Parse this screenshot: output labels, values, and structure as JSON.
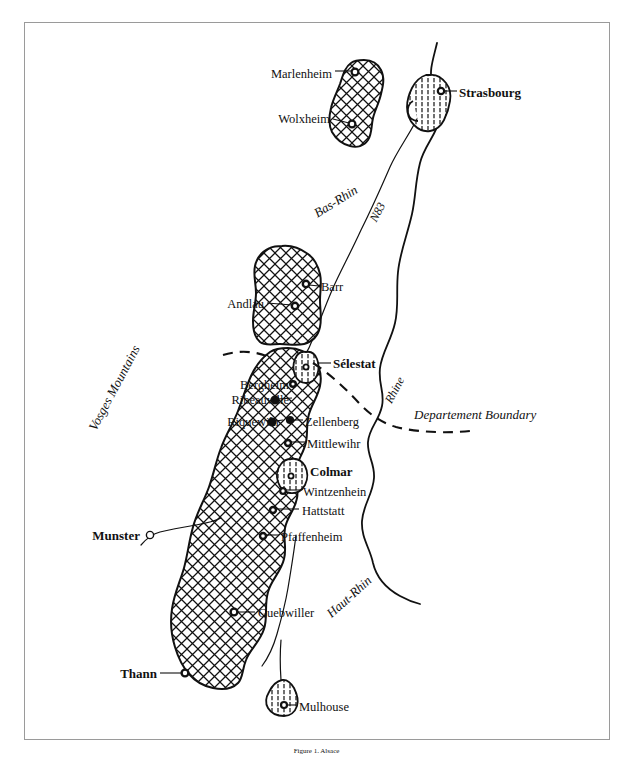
{
  "figure": {
    "kind": "map",
    "caption": "Figure 1. Alsace"
  },
  "map": {
    "title_hidden": "Alsace wine region map",
    "regions": [
      {
        "name": "Bas-Rhin",
        "style": "italic-rotated",
        "x": 338,
        "y": 205,
        "rotation": -32
      },
      {
        "name": "Haut-Rhin",
        "style": "italic-rotated",
        "x": 352,
        "y": 600,
        "rotation": -42
      },
      {
        "name": "Vosges Mountains",
        "style": "italic-rotated",
        "x": 118,
        "y": 390,
        "rotation": -62
      }
    ],
    "features": [
      {
        "name": "Rhine",
        "type": "river-label",
        "x": 398,
        "y": 392,
        "rotation": -62
      },
      {
        "name": "N83",
        "type": "road-label",
        "x": 381,
        "y": 214,
        "rotation": -62
      },
      {
        "name": "Departement Boundary",
        "type": "boundary-label",
        "x": 414,
        "y": 418,
        "rotation": 0
      }
    ],
    "places": [
      {
        "label": "Marlenheim",
        "bold": false,
        "anchor": "end",
        "tx": 332,
        "ty": 74,
        "mx": 355,
        "my": 72,
        "marker": "ring"
      },
      {
        "label": "Wolxheim",
        "bold": false,
        "anchor": "end",
        "tx": 330,
        "ty": 119,
        "mx": 352,
        "my": 124,
        "marker": "ring"
      },
      {
        "label": "Strasbourg",
        "bold": true,
        "anchor": "start",
        "tx": 459,
        "ty": 94,
        "mx": 441,
        "my": 91,
        "marker": "ring"
      },
      {
        "label": "Barr",
        "bold": false,
        "anchor": "start",
        "tx": 321,
        "ty": 289,
        "mx": 306,
        "my": 284,
        "marker": "ring"
      },
      {
        "label": "Andlau",
        "bold": false,
        "anchor": "end",
        "tx": 264,
        "ty": 303,
        "mx": 295,
        "my": 306,
        "marker": "ring"
      },
      {
        "label": "Sélestat",
        "bold": true,
        "anchor": "start",
        "tx": 333,
        "ty": 364,
        "mx": 313,
        "my": 362,
        "marker": "urban"
      },
      {
        "label": "Bergheim",
        "bold": false,
        "anchor": "end",
        "tx": 289,
        "ty": 387,
        "mx": 293,
        "my": 384,
        "marker": "ring"
      },
      {
        "label": "Ribeauville",
        "bold": false,
        "anchor": "end",
        "tx": 289,
        "ty": 401,
        "mx": 275,
        "my": 400,
        "marker": "ring"
      },
      {
        "label": "Riquewihr",
        "bold": false,
        "anchor": "end",
        "tx": 280,
        "ty": 422,
        "mx": 272,
        "my": 422,
        "marker": "ring"
      },
      {
        "label": "Zellenberg",
        "bold": false,
        "anchor": "start",
        "tx": 305,
        "ty": 423,
        "mx": 290,
        "my": 420,
        "marker": "ring"
      },
      {
        "label": "Mittlewihr",
        "bold": false,
        "anchor": "start",
        "tx": 307,
        "ty": 445,
        "mx": 288,
        "my": 443,
        "marker": "ring"
      },
      {
        "label": "Colmar",
        "bold": true,
        "anchor": "start",
        "tx": 310,
        "ty": 471,
        "mx": 293,
        "my": 470,
        "marker": "urban"
      },
      {
        "label": "Wintzenhein",
        "bold": false,
        "anchor": "start",
        "tx": 303,
        "ty": 493,
        "mx": 283,
        "my": 491,
        "marker": "ring"
      },
      {
        "label": "Hattstatt",
        "bold": false,
        "anchor": "start",
        "tx": 302,
        "ty": 512,
        "mx": 273,
        "my": 510,
        "marker": "ring"
      },
      {
        "label": "Pfaffenheim",
        "bold": false,
        "anchor": "start",
        "tx": 281,
        "ty": 538,
        "mx": 263,
        "my": 536,
        "marker": "ring"
      },
      {
        "label": "Munster",
        "bold": true,
        "anchor": "end",
        "tx": 140,
        "ty": 536,
        "mx": 150,
        "my": 535,
        "marker": "hollow"
      },
      {
        "label": "Guebwiller",
        "bold": false,
        "anchor": "start",
        "tx": 258,
        "ty": 615,
        "mx": 234,
        "my": 612,
        "marker": "ring"
      },
      {
        "label": "Thann",
        "bold": true,
        "anchor": "end",
        "tx": 157,
        "ty": 676,
        "mx": 185,
        "my": 673,
        "marker": "ring"
      },
      {
        "label": "Mulhouse",
        "bold": false,
        "anchor": "start",
        "tx": 299,
        "ty": 707,
        "mx": 285,
        "my": 705,
        "marker": "ring"
      }
    ],
    "legend": {
      "vineyard_pattern": "cross-hatch",
      "urban_pattern": "vertical-hatch",
      "boundary_pattern": "dashed"
    },
    "colors": {
      "ink": "#111111",
      "paper": "#ffffff",
      "frame": "#9a9a9a",
      "caption": "#b9b9b9"
    }
  }
}
